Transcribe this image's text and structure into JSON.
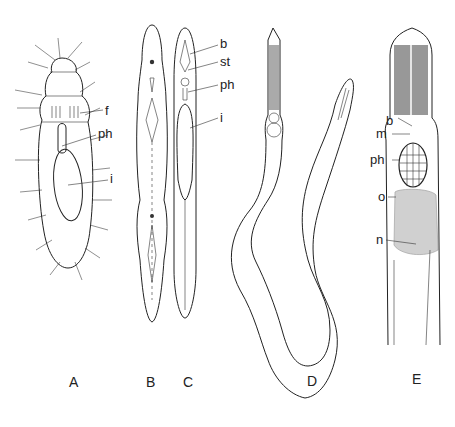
{
  "figure": {
    "panels": [
      {
        "id": "A",
        "label": "A",
        "structures": [
          "f",
          "ph",
          "i"
        ]
      },
      {
        "id": "B",
        "label": "B",
        "structures": []
      },
      {
        "id": "C",
        "label": "C",
        "structures": [
          "b",
          "st",
          "ph",
          "i"
        ]
      },
      {
        "id": "D",
        "label": "D",
        "structures": []
      },
      {
        "id": "E",
        "label": "E",
        "structures": [
          "b",
          "m",
          "ph",
          "o",
          "n"
        ]
      }
    ],
    "annotations": {
      "a_f": "f",
      "a_ph": "ph",
      "a_i": "i",
      "c_b": "b",
      "c_st": "st",
      "c_ph": "ph",
      "c_i": "i",
      "e_b": "b",
      "e_m": "m",
      "e_ph": "ph",
      "e_o": "o",
      "e_n": "n"
    }
  }
}
